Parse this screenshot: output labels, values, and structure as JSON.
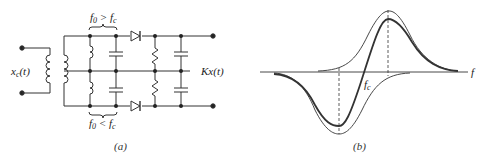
{
  "figure_a": {
    "caption": "(a)",
    "input_label": "x",
    "input_sub": "c",
    "input_arg": "(t)",
    "output_label": "Kx(t)",
    "top_tank_label": "f",
    "top_tank_sub": "0",
    "top_tank_rel": " > f",
    "top_tank_rel_sub": "c",
    "bottom_tank_label": "f",
    "bottom_tank_sub": "0",
    "bottom_tank_rel": " < f",
    "bottom_tank_rel_sub": "c"
  },
  "figure_b": {
    "caption": "(b)",
    "axis_label": "f",
    "center_label": "f",
    "center_sub": "c"
  },
  "colors": {
    "ink": "#222222",
    "background": "#ffffff"
  }
}
